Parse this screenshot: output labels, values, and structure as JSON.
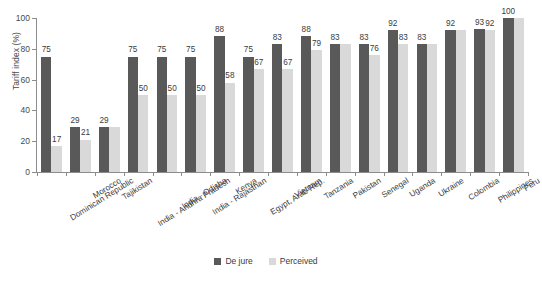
{
  "chart_data": {
    "type": "bar",
    "title": "",
    "xlabel": "",
    "ylabel": "Tariff index (%)",
    "ylim": [
      0,
      100
    ],
    "yticks": [
      0,
      20,
      40,
      60,
      80,
      100
    ],
    "grid": false,
    "legend_position": "bottom-center",
    "categories": [
      "Dominican Republic",
      "Morocco",
      "Tajikistan",
      "India - Andhra Pradesh",
      "India - Odisha",
      "India - Rajasthan",
      "Kenya",
      "Egypt, Arab Rep.",
      "Vietnam",
      "Tanzania",
      "Pakistan",
      "Senegal",
      "Uganda",
      "Ukraine",
      "Colombia",
      "Philippines",
      "Peru"
    ],
    "series": [
      {
        "name": "De jure",
        "color": "#595959",
        "values": [
          75,
          29,
          29,
          75,
          75,
          75,
          88,
          75,
          83,
          88,
          83,
          83,
          92,
          83,
          92,
          93,
          100
        ]
      },
      {
        "name": "Perceived",
        "color": "#d9d9d9",
        "values": [
          17,
          21,
          29,
          50,
          50,
          50,
          58,
          67,
          67,
          79,
          83,
          76,
          83,
          83,
          92,
          92,
          100
        ]
      }
    ],
    "point_labels": [
      {
        "category": "Dominican Republic",
        "dejure": "75",
        "perceived": "17"
      },
      {
        "category": "Morocco",
        "dejure": "29",
        "perceived": "21"
      },
      {
        "category": "Tajikistan",
        "dejure": "29",
        "perceived": ""
      },
      {
        "category": "India - Andhra Pradesh",
        "dejure": "75",
        "perceived": "50"
      },
      {
        "category": "India - Odisha",
        "dejure": "75",
        "perceived": "50"
      },
      {
        "category": "India - Rajasthan",
        "dejure": "75",
        "perceived": "50"
      },
      {
        "category": "Kenya",
        "dejure": "88",
        "perceived": "58"
      },
      {
        "category": "Egypt, Arab Rep.",
        "dejure": "75",
        "perceived": "67"
      },
      {
        "category": "Vietnam",
        "dejure": "83",
        "perceived": "67"
      },
      {
        "category": "Tanzania",
        "dejure": "88",
        "perceived": "79"
      },
      {
        "category": "Pakistan",
        "dejure": "83",
        "perceived": ""
      },
      {
        "category": "Senegal",
        "dejure": "83",
        "perceived": "76"
      },
      {
        "category": "Uganda",
        "dejure": "92",
        "perceived": "83"
      },
      {
        "category": "Ukraine",
        "dejure": "83",
        "perceived": ""
      },
      {
        "category": "Colombia",
        "dejure": "92",
        "perceived": ""
      },
      {
        "category": "Philippines",
        "dejure": "93",
        "perceived": "92"
      },
      {
        "category": "Peru",
        "dejure": "100",
        "perceived": ""
      }
    ]
  },
  "axis": {
    "y_title": "Tariff index (%)",
    "y_tick_labels": [
      "100",
      "80",
      "60",
      "40",
      "20",
      "0"
    ]
  },
  "legend": {
    "items": [
      {
        "label": "De jure",
        "color": "#595959"
      },
      {
        "label": "Perceived",
        "color": "#d9d9d9"
      }
    ]
  }
}
